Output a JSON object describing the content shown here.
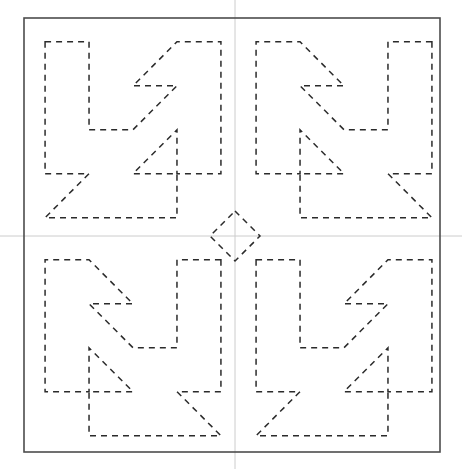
{
  "figure": {
    "title": "",
    "width": 462,
    "height": 469,
    "background_color": "#ffffff",
    "frame": {
      "name": "outer-frame",
      "x": 24,
      "y": 18,
      "width": 416,
      "height": 434,
      "stroke_color": "#4d4d4d",
      "stroke_width": 1.6,
      "fill": "none"
    },
    "axes": {
      "name": "center-axes",
      "stroke_color": "#cccccc",
      "stroke_width": 1,
      "vertical_x": 235,
      "horizontal_y": 236,
      "vertical_from_y": 0,
      "vertical_to_y": 469,
      "horizontal_from_x": 0,
      "horizontal_to_x": 462
    },
    "paths": {
      "stroke_color": "#2b2b2b",
      "stroke_width": 1.5,
      "dash_pattern": "6 5",
      "fill": "none"
    },
    "tiles": [
      {
        "name": "pinwheel-tile-top-left",
        "quadrant": "top-left",
        "orientation": "base",
        "origin_x": 24,
        "origin_y": 18,
        "size": 218
      },
      {
        "name": "pinwheel-tile-top-right",
        "quadrant": "top-right",
        "orientation": "mirror-x",
        "origin_x": 235,
        "origin_y": 18,
        "size": 218
      },
      {
        "name": "pinwheel-tile-bottom-left",
        "quadrant": "bottom-left",
        "orientation": "mirror-x",
        "origin_x": 24,
        "origin_y": 236,
        "size": 218
      },
      {
        "name": "pinwheel-tile-bottom-right",
        "quadrant": "bottom-right",
        "orientation": "base",
        "origin_x": 235,
        "origin_y": 236,
        "size": 218
      }
    ],
    "center_diamond": {
      "name": "center-diamond",
      "cx": 235,
      "cy": 236,
      "radius": 25
    },
    "geometry": {
      "description": "Pinwheel (swastika-like) dashed outline tile, repeated in a 2x2 grid with alternating mirror symmetry; thin grey crosshair axes mark the image centre; a small diamond sits at the exact centre where the four tiles meet.",
      "tile_unit": 218,
      "arm_width": 48,
      "pinwheel_path_base": "M 23 26 L 71 26 L 71 122 L 119 122 L 167 74 L 119 74 L 167 26 L 215 26 L 215 170 L 167 170 L 167 122 L 119 170 L 167 170 L 167 218 L 119 218 L 71 218 L 23 218 L 71 170 L 23 170 Z",
      "pinwheel_path_simplified": "M 23 26 H 71 V 122 H 119 L 167 74 H 119 L 167 26 H 215 V 170 H 167 V 122 L 119 170 H 167 V 218 H 23 L 71 170 H 23 Z"
    }
  }
}
